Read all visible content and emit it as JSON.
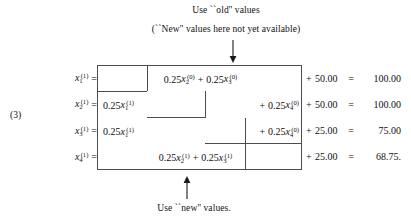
{
  "figure": {
    "equation_number": "(3)",
    "annotations": {
      "top_line_1": "Use ``old'' values",
      "top_line_2": "(``New'' values here not yet available)",
      "bottom_line": "Use ``new'' values.",
      "top_arrow_direction": "down",
      "bottom_arrow_direction": "up"
    },
    "colors": {
      "text": "#101010",
      "box_line": "#4c4c4c",
      "background": "#ffffff"
    },
    "rows": [
      {
        "lhs_var": "x",
        "lhs_sub": "1",
        "lhs_sup": "(1)",
        "lhs_equals": "=",
        "left_term": "",
        "center_term": "0.25x₂⁽⁰⁾ + 0.25x₃⁽⁰⁾",
        "center_coef_1": "0.25",
        "center_var_1": "x",
        "center_sub_1": "2",
        "center_sup_1": "(0)",
        "center_op": "+",
        "center_coef_2": "0.25",
        "center_var_2": "x",
        "center_sub_2": "3",
        "center_sup_2": "(0)",
        "right_term": "",
        "plus": "+",
        "constant": "50.00",
        "equals": "=",
        "result": "100.00"
      },
      {
        "lhs_var": "x",
        "lhs_sub": "2",
        "lhs_sup": "(1)",
        "lhs_equals": "=",
        "left_coef": "0.25",
        "left_var": "x",
        "left_sub": "1",
        "left_sup": "(1)",
        "center_term": "",
        "right_op": "+",
        "right_coef": "0.25",
        "right_var": "x",
        "right_sub": "4",
        "right_sup": "(0)",
        "plus": "+",
        "constant": "50.00",
        "equals": "=",
        "result": "100.00"
      },
      {
        "lhs_var": "x",
        "lhs_sub": "3",
        "lhs_sup": "(1)",
        "lhs_equals": "=",
        "left_coef": "0.25",
        "left_var": "x",
        "left_sub": "1",
        "left_sup": "(1)",
        "center_term": "",
        "right_op": "+",
        "right_coef": "0.25",
        "right_var": "x",
        "right_sub": "4",
        "right_sup": "(0)",
        "plus": "+",
        "constant": "25.00",
        "equals": "=",
        "result": "75.00"
      },
      {
        "lhs_var": "x",
        "lhs_sub": "4",
        "lhs_sup": "(1)",
        "lhs_equals": "=",
        "left_term": "",
        "center_coef_1": "0.25",
        "center_var_1": "x",
        "center_sub_1": "2",
        "center_sup_1": "(1)",
        "center_op": "+",
        "center_coef_2": "0.25",
        "center_var_2": "x",
        "center_sub_2": "3",
        "center_sup_2": "(1)",
        "right_term": "",
        "plus": "+",
        "constant": "25.00",
        "equals": "=",
        "result": "68.75."
      }
    ]
  }
}
